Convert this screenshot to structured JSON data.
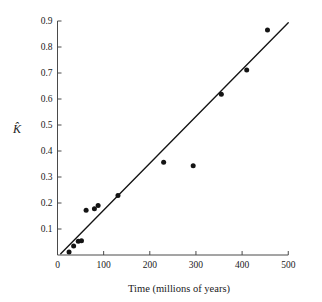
{
  "chart_data": {
    "type": "scatter",
    "title": "",
    "xlabel": "Time (millions of years)",
    "ylabel": "K̂",
    "xlim": [
      0,
      500
    ],
    "ylim": [
      0,
      0.9
    ],
    "grid": false,
    "legend": null,
    "xticks": [
      0,
      100,
      200,
      300,
      400,
      500
    ],
    "xtick_labels": [
      "0",
      "100",
      "200",
      "300",
      "400",
      "500"
    ],
    "yticks": [
      0.1,
      0.2,
      0.3,
      0.4,
      0.5,
      0.6,
      0.7,
      0.8,
      0.9
    ],
    "ytick_labels": [
      "0.1",
      "0.2",
      "0.3",
      "0.4",
      "0.5",
      "0.6",
      "0.7",
      "0.8",
      "0.9"
    ],
    "series": [
      {
        "name": "observations",
        "type": "scatter",
        "marker": "filled-circle",
        "color": "#141414",
        "points": [
          {
            "x": 25,
            "y": 0.012
          },
          {
            "x": 35,
            "y": 0.035
          },
          {
            "x": 45,
            "y": 0.053
          },
          {
            "x": 52,
            "y": 0.055
          },
          {
            "x": 62,
            "y": 0.172
          },
          {
            "x": 80,
            "y": 0.178
          },
          {
            "x": 88,
            "y": 0.19
          },
          {
            "x": 131,
            "y": 0.229
          },
          {
            "x": 230,
            "y": 0.357
          },
          {
            "x": 294,
            "y": 0.343
          },
          {
            "x": 355,
            "y": 0.618
          },
          {
            "x": 410,
            "y": 0.712
          },
          {
            "x": 455,
            "y": 0.865
          }
        ]
      },
      {
        "name": "regression-line",
        "type": "line",
        "color": "#141414",
        "points": [
          {
            "x": 7,
            "y": 0.005
          },
          {
            "x": 500,
            "y": 0.893
          }
        ]
      }
    ]
  },
  "axes": {
    "x_axis_label": "Time (millions of years)",
    "y_axis_label": "K̂"
  }
}
